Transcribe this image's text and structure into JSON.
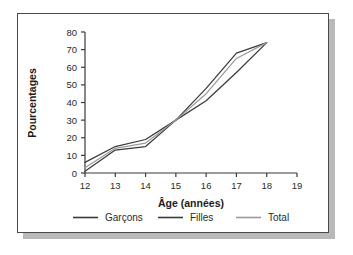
{
  "figure": {
    "background_color": "#ffffff",
    "frame_color": "#4a4a4a",
    "shadow_color": "#b9b9b9"
  },
  "chart_data": {
    "type": "line",
    "title": "",
    "subtitle": "",
    "xlabel": "Âge (années)",
    "ylabel": "Pourcentages",
    "x": [
      12,
      13,
      14,
      15,
      16,
      17,
      18
    ],
    "xlim": [
      12,
      19
    ],
    "ylim": [
      0,
      80
    ],
    "xticks": [
      12,
      13,
      14,
      15,
      16,
      17,
      18,
      19
    ],
    "xtick_labels": [
      "12",
      "13",
      "14",
      "15",
      "16",
      "17",
      "18",
      "19"
    ],
    "yticks": [
      0,
      10,
      20,
      30,
      40,
      50,
      60,
      70,
      80
    ],
    "ytick_labels": [
      "0",
      "10",
      "20",
      "30",
      "40",
      "50",
      "60",
      "70",
      "80"
    ],
    "grid": false,
    "legend_position": "below",
    "series": [
      {
        "name": "Garçons",
        "color": "#3a3a3a",
        "values": [
          6,
          15,
          19,
          30,
          41,
          57,
          74
        ]
      },
      {
        "name": "Filles",
        "color": "#3a3a3a",
        "values": [
          1,
          13,
          15,
          30,
          48,
          68,
          74
        ]
      },
      {
        "name": "Total",
        "color": "#9a9a9a",
        "values": [
          3,
          14,
          17,
          30,
          45,
          65,
          74
        ]
      }
    ]
  },
  "legend": {
    "items": [
      {
        "label": "Garçons",
        "color": "#3a3a3a"
      },
      {
        "label": "Filles",
        "color": "#3a3a3a"
      },
      {
        "label": "Total",
        "color": "#9a9a9a"
      }
    ]
  }
}
